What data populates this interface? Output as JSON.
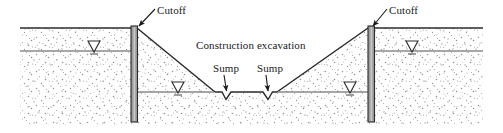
{
  "figure": {
    "type": "geotechnical-cross-section"
  },
  "labels": {
    "cutoff_left": "Cutoff",
    "cutoff_right": "Cutoff",
    "excavation": "Construction excavation",
    "sump_left": "Sump",
    "sump_right": "Sump"
  },
  "icons": {
    "water_table_symbol": "water-table-triangle",
    "leader_arrow": "leader-arrow"
  },
  "colors": {
    "line": "#1a1a1a",
    "soil_stipple": "#9a9a9a",
    "cutoff_wall_fill": "#9d9d9d",
    "cutoff_wall_stroke": "#2b2b2b",
    "water_line": "#6e6e6e",
    "background": "#ffffff"
  },
  "elements": {
    "ground_surface_label": "ground surface",
    "water_table_outer_label": "original water table",
    "water_table_inner_label": "lowered water table",
    "excavation_floor_label": "excavation floor",
    "soil_mass_label": "soil mass",
    "cutoff_wall_left_label": "left cutoff wall",
    "cutoff_wall_right_label": "right cutoff wall",
    "slope_left_label": "left excavation slope",
    "slope_right_label": "right excavation slope",
    "sump_notch_left_label": "left sump notch",
    "sump_notch_right_label": "right sump notch"
  }
}
